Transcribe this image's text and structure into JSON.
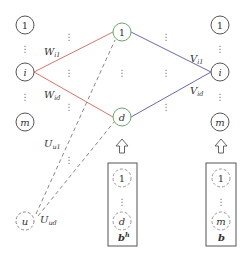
{
  "diagram": {
    "colors": {
      "node_stroke": "#555555",
      "hidden_stroke": "#6aa86a",
      "encoder_edge": "#d9756a",
      "decoder_edge": "#6a6aa8",
      "dashed": "#888888",
      "box_stroke": "#555555"
    },
    "input_layer": {
      "nodes": [
        {
          "label": "1",
          "italic": false
        },
        {
          "label": "i",
          "italic": true
        },
        {
          "label": "m",
          "italic": true
        }
      ],
      "ellipsis": "⋮"
    },
    "user_node": {
      "label": "u",
      "italic": true
    },
    "hidden_layer": {
      "nodes": [
        {
          "label": "1",
          "italic": false
        },
        {
          "label": "d",
          "italic": true
        }
      ],
      "ellipsis": "⋮"
    },
    "output_layer": {
      "nodes": [
        {
          "label": "1",
          "italic": false
        },
        {
          "label": "i",
          "italic": true
        },
        {
          "label": "m",
          "italic": true
        }
      ],
      "ellipsis": "⋮"
    },
    "edge_labels": {
      "w_i1": {
        "main": "W",
        "sub": "i1"
      },
      "w_id": {
        "main": "W",
        "sub": "id"
      },
      "u_u1": {
        "main": "U",
        "sub": "u1"
      },
      "u_ud": {
        "main": "U",
        "sub": "ud"
      },
      "v_i1": {
        "main": "V",
        "sub": "i1"
      },
      "v_id": {
        "main": "V",
        "sub": "id"
      }
    },
    "bias_hidden": {
      "nodes": [
        "1",
        "d"
      ],
      "label_main": "b",
      "label_sup": "h",
      "ellipsis": "⋮"
    },
    "bias_output": {
      "nodes": [
        "1",
        "m"
      ],
      "label_main": "b",
      "ellipsis": "⋮"
    },
    "arrow_glyph": "⇧"
  }
}
